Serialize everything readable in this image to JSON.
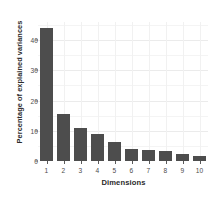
{
  "chart_data": {
    "type": "bar",
    "title": "",
    "subtitle": "",
    "xlabel": "Dimensions",
    "ylabel": "Percentage of explained variances",
    "categories": [
      "1",
      "2",
      "3",
      "4",
      "5",
      "6",
      "7",
      "8",
      "9",
      "10"
    ],
    "values": [
      44.0,
      15.5,
      11.0,
      8.8,
      6.3,
      4.1,
      3.7,
      3.2,
      2.3,
      1.8
    ],
    "ylim": [
      0,
      46
    ],
    "y_ticks": [
      "0",
      "10",
      "20",
      "30",
      "40"
    ],
    "y_tick_values": [
      0,
      10,
      20,
      30,
      40
    ],
    "grid": true,
    "legend": "none",
    "bar_color": "#4d4d4d",
    "panel_background": "#ffffff",
    "grid_color": "#ebebeb",
    "axis_text_color": "#4d4d4d",
    "axis_title_color": "#2b2b2b"
  }
}
